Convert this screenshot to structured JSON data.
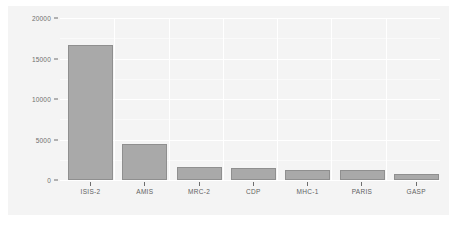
{
  "chart_data": {
    "type": "bar",
    "title": "",
    "subtitle": "",
    "xlabel": "",
    "ylabel": "",
    "categories": [
      "ISIS-2",
      "AMIS",
      "MRC-2",
      "CDP",
      "MHC-1",
      "PARIS",
      "GASP"
    ],
    "values": [
      17300,
      4600,
      1670,
      1540,
      1280,
      1280,
      770
    ],
    "ytick_labels": [
      "0",
      "5000",
      "10000",
      "15000",
      "20000"
    ],
    "ytick_values": [
      0,
      5000,
      10000,
      15000,
      20000
    ],
    "ylim": [
      0,
      20800
    ],
    "grid": "horizontal-and-vertical-white",
    "legend": "none",
    "colors": {
      "bar_fill": "#a9a9a9",
      "bar_border": "#8f8f8f",
      "panel_background": "#f4f4f4",
      "page_background": "#ffffff",
      "gridline": "#ffffff",
      "tick_label": "#6e6e6e",
      "axis_label": "#5f5f5f"
    }
  }
}
